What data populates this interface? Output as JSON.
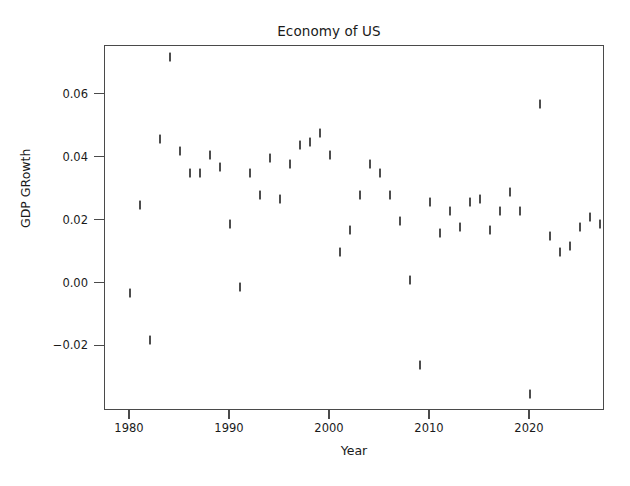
{
  "chart_data": {
    "type": "scatter",
    "title": "Economy of US",
    "xlabel": "Year",
    "ylabel": "GDP GRowth",
    "grid": false,
    "legend": null,
    "marker_style": "vertical-tick",
    "marker_color": "#4d4d4d",
    "xlim": [
      1977.5,
      2027.5
    ],
    "ylim": [
      -0.0405,
      0.0755
    ],
    "xticks": [
      1980,
      1990,
      2000,
      2010,
      2020
    ],
    "xtick_labels": [
      "1980",
      "1990",
      "2000",
      "2010",
      "2020"
    ],
    "yticks": [
      -0.02,
      0.0,
      0.02,
      0.04,
      0.06
    ],
    "ytick_labels": [
      "-0.02",
      "0.00",
      "0.02",
      "0.04",
      "0.06"
    ],
    "x": [
      1980,
      1981,
      1982,
      1983,
      1984,
      1985,
      1986,
      1987,
      1988,
      1989,
      1990,
      1991,
      1992,
      1993,
      1994,
      1995,
      1996,
      1997,
      1998,
      1999,
      2000,
      2001,
      2002,
      2003,
      2004,
      2005,
      2006,
      2007,
      2008,
      2009,
      2010,
      2011,
      2012,
      2013,
      2014,
      2015,
      2016,
      2017,
      2018,
      2019,
      2020,
      2021,
      2022,
      2023,
      2024,
      2025,
      2026
    ],
    "y": [
      -0.003,
      0.025,
      -0.018,
      0.046,
      0.072,
      0.042,
      0.035,
      0.035,
      0.041,
      0.037,
      0.019,
      -0.001,
      0.035,
      0.028,
      0.04,
      0.027,
      0.038,
      0.044,
      0.045,
      0.048,
      0.041,
      0.01,
      0.017,
      0.028,
      0.038,
      0.035,
      0.028,
      0.02,
      0.001,
      -0.026,
      0.026,
      0.016,
      0.023,
      0.018,
      0.026,
      0.027,
      0.017,
      0.023,
      0.029,
      0.023,
      -0.035,
      0.057,
      0.015,
      0.01,
      0.012,
      0.018,
      0.021,
      0.019
    ],
    "points": [
      {
        "year": 1980,
        "growth": -0.003
      },
      {
        "year": 1981,
        "growth": 0.025
      },
      {
        "year": 1982,
        "growth": -0.018
      },
      {
        "year": 1983,
        "growth": 0.046
      },
      {
        "year": 1984,
        "growth": 0.072
      },
      {
        "year": 1985,
        "growth": 0.042
      },
      {
        "year": 1986,
        "growth": 0.035
      },
      {
        "year": 1987,
        "growth": 0.035
      },
      {
        "year": 1988,
        "growth": 0.041
      },
      {
        "year": 1989,
        "growth": 0.037
      },
      {
        "year": 1990,
        "growth": 0.019
      },
      {
        "year": 1991,
        "growth": -0.001
      },
      {
        "year": 1992,
        "growth": 0.035
      },
      {
        "year": 1993,
        "growth": 0.028
      },
      {
        "year": 1994,
        "growth": 0.04
      },
      {
        "year": 1995,
        "growth": 0.027
      },
      {
        "year": 1996,
        "growth": 0.038
      },
      {
        "year": 1997,
        "growth": 0.044
      },
      {
        "year": 1998,
        "growth": 0.045
      },
      {
        "year": 1999,
        "growth": 0.048
      },
      {
        "year": 2000,
        "growth": 0.041
      },
      {
        "year": 2001,
        "growth": 0.01
      },
      {
        "year": 2002,
        "growth": 0.017
      },
      {
        "year": 2003,
        "growth": 0.028
      },
      {
        "year": 2004,
        "growth": 0.038
      },
      {
        "year": 2005,
        "growth": 0.035
      },
      {
        "year": 2006,
        "growth": 0.028
      },
      {
        "year": 2007,
        "growth": 0.02
      },
      {
        "year": 2008,
        "growth": 0.001
      },
      {
        "year": 2009,
        "growth": -0.026
      },
      {
        "year": 2010,
        "growth": 0.026
      },
      {
        "year": 2011,
        "growth": 0.016
      },
      {
        "year": 2012,
        "growth": 0.023
      },
      {
        "year": 2013,
        "growth": 0.018
      },
      {
        "year": 2014,
        "growth": 0.026
      },
      {
        "year": 2015,
        "growth": 0.027
      },
      {
        "year": 2016,
        "growth": 0.017
      },
      {
        "year": 2017,
        "growth": 0.023
      },
      {
        "year": 2018,
        "growth": 0.029
      },
      {
        "year": 2019,
        "growth": 0.023
      },
      {
        "year": 2020,
        "growth": -0.035
      },
      {
        "year": 2021,
        "growth": 0.057
      },
      {
        "year": 2022,
        "growth": 0.015
      },
      {
        "year": 2023,
        "growth": 0.01
      },
      {
        "year": 2024,
        "growth": 0.012
      },
      {
        "year": 2025,
        "growth": 0.018
      },
      {
        "year": 2026,
        "growth": 0.021
      },
      {
        "year": 2027,
        "growth": 0.019
      }
    ]
  }
}
